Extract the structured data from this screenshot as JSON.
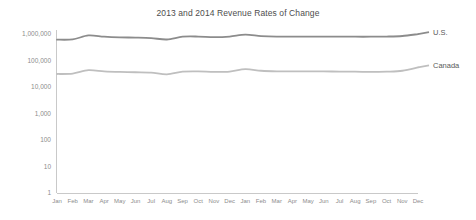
{
  "chart_data": {
    "type": "line",
    "title": "2013 and 2014 Revenue Rates of Change",
    "xlabel": "",
    "ylabel": "",
    "yscale": "log",
    "ylim": [
      1,
      1000000
    ],
    "ytick_labels": [
      "1,000,000",
      "100,000",
      "10,000",
      "1,000",
      "100",
      "10",
      "1"
    ],
    "ytick_values": [
      1000000,
      100000,
      10000,
      1000,
      100,
      10,
      1
    ],
    "grid": false,
    "legend_position": "right-of-plot-inline",
    "categories": [
      "Jan",
      "Feb",
      "Mar",
      "Apr",
      "May",
      "Jun",
      "Jul",
      "Aug",
      "Sep",
      "Oct",
      "Nov",
      "Dec",
      "Jan",
      "Feb",
      "Mar",
      "Apr",
      "May",
      "Jun",
      "Jul",
      "Aug",
      "Sep",
      "Oct",
      "Nov",
      "Dec"
    ],
    "series": [
      {
        "name": "U.S.",
        "color": "#8c8c8c",
        "values": [
          610000,
          625000,
          880000,
          790000,
          745000,
          730000,
          700000,
          620000,
          790000,
          800000,
          760000,
          800000,
          950000,
          830000,
          790000,
          800000,
          800000,
          800000,
          800000,
          790000,
          790000,
          800000,
          840000,
          990000
        ]
      },
      {
        "name": "Canada",
        "color": "#bfbfbf",
        "values": [
          31000,
          32000,
          43000,
          39000,
          37000,
          36000,
          35000,
          30000,
          38000,
          39000,
          37000,
          38000,
          47000,
          41000,
          39000,
          39000,
          39000,
          39000,
          38000,
          38000,
          37000,
          38000,
          41000,
          55000
        ]
      }
    ]
  },
  "labels": {
    "us": "U.S.",
    "canada": "Canada"
  }
}
